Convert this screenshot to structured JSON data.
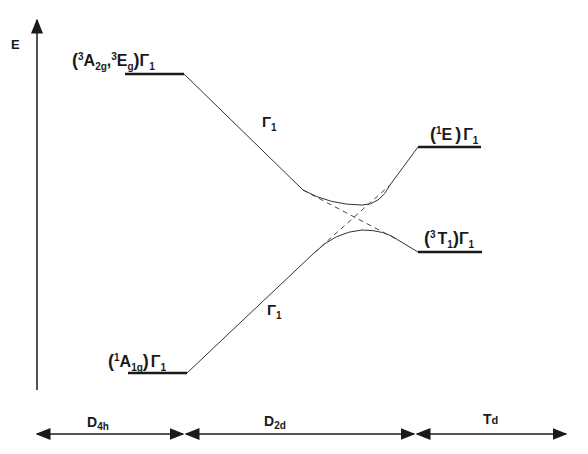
{
  "diagram": {
    "type": "energy-level correlation diagram",
    "y_axis_label": "E",
    "levels": {
      "upper_left": {
        "label_open": "(",
        "sup1": "3",
        "sym1": "A",
        "sub1": "2g",
        "sep": ",",
        "sup2": "3",
        "sym2": "E",
        "sub2": "g",
        "label_close": ")",
        "gamma": "Γ",
        "gamma_sub": "1"
      },
      "lower_left": {
        "label_open": "(",
        "sup1": "1",
        "sym1": "A",
        "sub1": "1g",
        "label_close": ")",
        "gamma": "Γ",
        "gamma_sub": "1"
      },
      "upper_right": {
        "label_open": "(",
        "sup1": "1",
        "sym1": "E",
        "label_close": ")",
        "gamma": "Γ",
        "gamma_sub": "1"
      },
      "lower_right": {
        "label_open": "(",
        "sup1": "3",
        "sym1": "T",
        "sub1": "1",
        "label_close": ")",
        "gamma": "Γ",
        "gamma_sub": "1"
      }
    },
    "line_labels": {
      "upper": {
        "gamma": "Γ",
        "sub": "1"
      },
      "lower": {
        "gamma": "Γ",
        "sub": "1"
      }
    },
    "symmetry_regions": [
      {
        "main": "D",
        "sub": "4h"
      },
      {
        "main": "D",
        "sub": "2d"
      },
      {
        "main": "T",
        "sub": "d"
      }
    ]
  }
}
